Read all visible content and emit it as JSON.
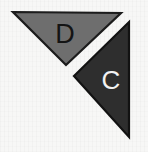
{
  "figure": {
    "name": "two-labeled-triangles",
    "width": 148,
    "height": 152,
    "background_color": "#f7f7f6"
  },
  "shapes": [
    {
      "id": "triangle-d",
      "label": "D",
      "kind": "triangle",
      "orientation": "pointing-down",
      "fill_color": "#6e6e6e",
      "stroke_color": "#1c1c1c",
      "label_color": "#141414",
      "points": "13,12 121,13 66,65",
      "label_x": 65,
      "label_y": 34
    },
    {
      "id": "triangle-c",
      "label": "C",
      "kind": "triangle",
      "orientation": "pointing-left",
      "fill_color": "#2e2e2e",
      "stroke_color": "#121212",
      "label_color": "#f2f2f2",
      "points": "129,22 129,137 74,76",
      "label_x": 111,
      "label_y": 80
    }
  ]
}
